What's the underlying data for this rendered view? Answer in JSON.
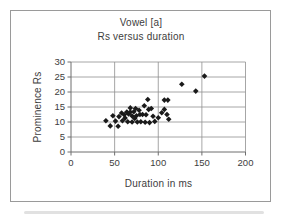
{
  "chart": {
    "title_line1": "Vowel [a]",
    "title_line2": "Rs versus duration",
    "xlabel": "Duration in ms",
    "ylabel": "Prominence Rs"
  },
  "colors": {
    "text": "#3d3d3d",
    "frame_border": "#9a9a9a",
    "gridline": "#8f8f8f",
    "axis_line": "#6e6e6e",
    "marker": "#1a1a1a",
    "background": "#ffffff"
  },
  "chart_data": {
    "type": "scatter",
    "title": "Vowel [a]",
    "subtitle": "Rs versus duration",
    "xlabel": "Duration in ms",
    "ylabel": "Prominence Rs",
    "xlim": [
      0,
      200
    ],
    "ylim": [
      0,
      30
    ],
    "x_ticks": [
      0,
      50,
      100,
      150,
      200
    ],
    "y_ticks": [
      0,
      5,
      10,
      15,
      20,
      25,
      30
    ],
    "grid": true,
    "legend": false,
    "marker": "diamond",
    "points": [
      [
        40,
        10.4
      ],
      [
        45,
        8.7
      ],
      [
        48,
        12.1
      ],
      [
        51,
        10.3
      ],
      [
        54,
        8.6
      ],
      [
        55,
        11.8
      ],
      [
        58,
        13.0
      ],
      [
        59,
        10.4
      ],
      [
        61,
        12.4
      ],
      [
        62,
        11.3
      ],
      [
        64,
        13.3
      ],
      [
        65,
        10.1
      ],
      [
        66,
        12.7
      ],
      [
        68,
        14.7
      ],
      [
        68,
        13.3
      ],
      [
        70,
        12.0
      ],
      [
        70,
        10.0
      ],
      [
        72,
        13.4
      ],
      [
        73,
        11.2
      ],
      [
        74,
        14.5
      ],
      [
        75,
        12.1
      ],
      [
        76,
        10.0
      ],
      [
        78,
        13.9
      ],
      [
        79,
        12.5
      ],
      [
        80,
        10.1
      ],
      [
        82,
        12.5
      ],
      [
        84,
        15.4
      ],
      [
        85,
        9.9
      ],
      [
        86,
        12.4
      ],
      [
        88,
        17.5
      ],
      [
        89,
        14.2
      ],
      [
        90,
        9.8
      ],
      [
        92,
        14.5
      ],
      [
        94,
        11.9
      ],
      [
        96,
        10.2
      ],
      [
        100,
        11.4
      ],
      [
        104,
        13.1
      ],
      [
        107,
        14.2
      ],
      [
        107,
        17.3
      ],
      [
        111,
        17.3
      ],
      [
        110,
        12.5
      ],
      [
        112,
        10.9
      ],
      [
        127,
        22.6
      ],
      [
        143,
        20.3
      ],
      [
        153,
        25.3
      ]
    ]
  }
}
